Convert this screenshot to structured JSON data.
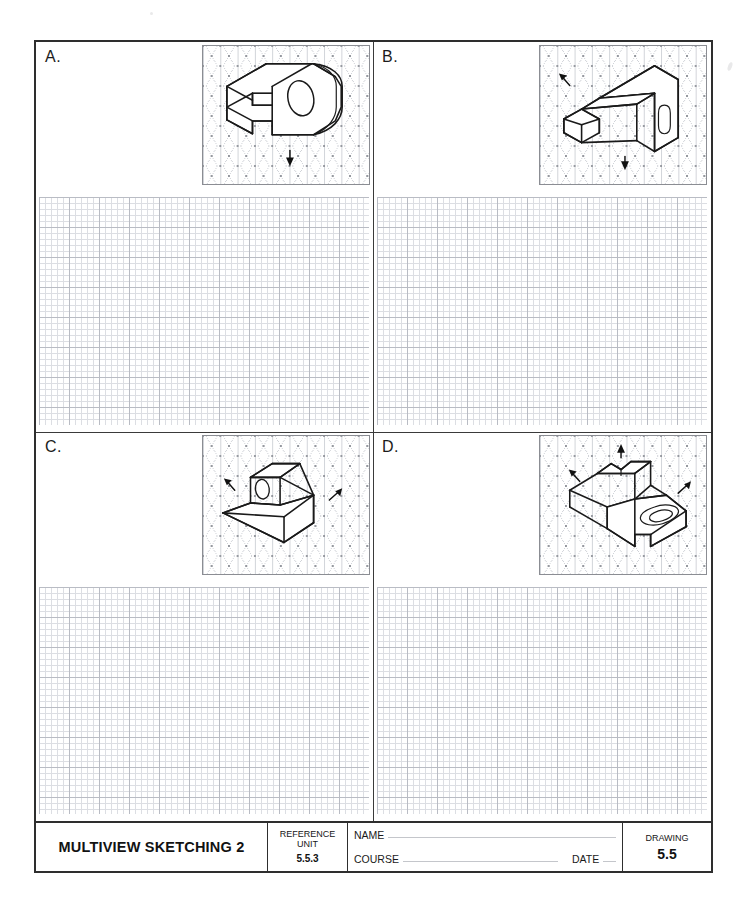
{
  "document": {
    "type": "engineering-worksheet",
    "title": "MULTIVIEW SKETCHING 2",
    "sheet_background": "#ffffff",
    "border_color": "#2e2e2e"
  },
  "quadrants": [
    {
      "id": "A",
      "label": "A.",
      "object_description": "C-shaped bracket with rounded end and through hole",
      "view_arrows": [
        "front-down"
      ]
    },
    {
      "id": "B",
      "label": "B.",
      "object_description": "Stepped rectangular block with vertical slot in upright back plate",
      "view_arrows": [
        "left-up",
        "front-down"
      ]
    },
    {
      "id": "C",
      "label": "C.",
      "object_description": "Angled wedge block with inclined face and through hole",
      "view_arrows": [
        "left-up",
        "right-up"
      ]
    },
    {
      "id": "D",
      "label": "D.",
      "object_description": "Stepped block with notched top, vertical rib and obround slot",
      "view_arrows": [
        "top-up",
        "left-up",
        "right-up"
      ]
    }
  ],
  "grid": {
    "square_minor_spacing_px": 6,
    "square_major_spacing_px": 30,
    "square_minor_color": "#dcdee3",
    "square_major_color": "#b9bcc4",
    "isometric_spacing_px": 20,
    "isometric_color": "#c9ccd2"
  },
  "title_block": {
    "title": "MULTIVIEW SKETCHING 2",
    "reference_unit_label_line1": "REFERENCE",
    "reference_unit_label_line2": "UNIT",
    "reference_unit_value": "5.5.3",
    "name_label": "NAME",
    "course_label": "COURSE",
    "date_label": "DATE",
    "name_value": "",
    "course_value": "",
    "date_value": "",
    "drawing_label": "DRAWING",
    "drawing_value": "5.5"
  }
}
